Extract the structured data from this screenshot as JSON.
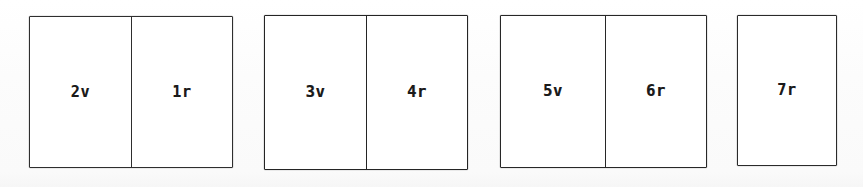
{
  "figure": {
    "type": "quire-collation-diagram",
    "background_color": "#ffffff",
    "ink_color": "#2b2b2b",
    "text_color": "#1a1a1a",
    "groups": [
      {
        "id": "quire-1",
        "leaves": [
          {
            "label": "2v"
          },
          {
            "label": "1r"
          }
        ]
      },
      {
        "id": "quire-2",
        "leaves": [
          {
            "label": "3v"
          },
          {
            "label": "4r"
          }
        ]
      },
      {
        "id": "quire-3",
        "leaves": [
          {
            "label": "5v"
          },
          {
            "label": "6r"
          }
        ]
      },
      {
        "id": "quire-4",
        "leaves": [
          {
            "label": "7r"
          }
        ]
      }
    ]
  }
}
